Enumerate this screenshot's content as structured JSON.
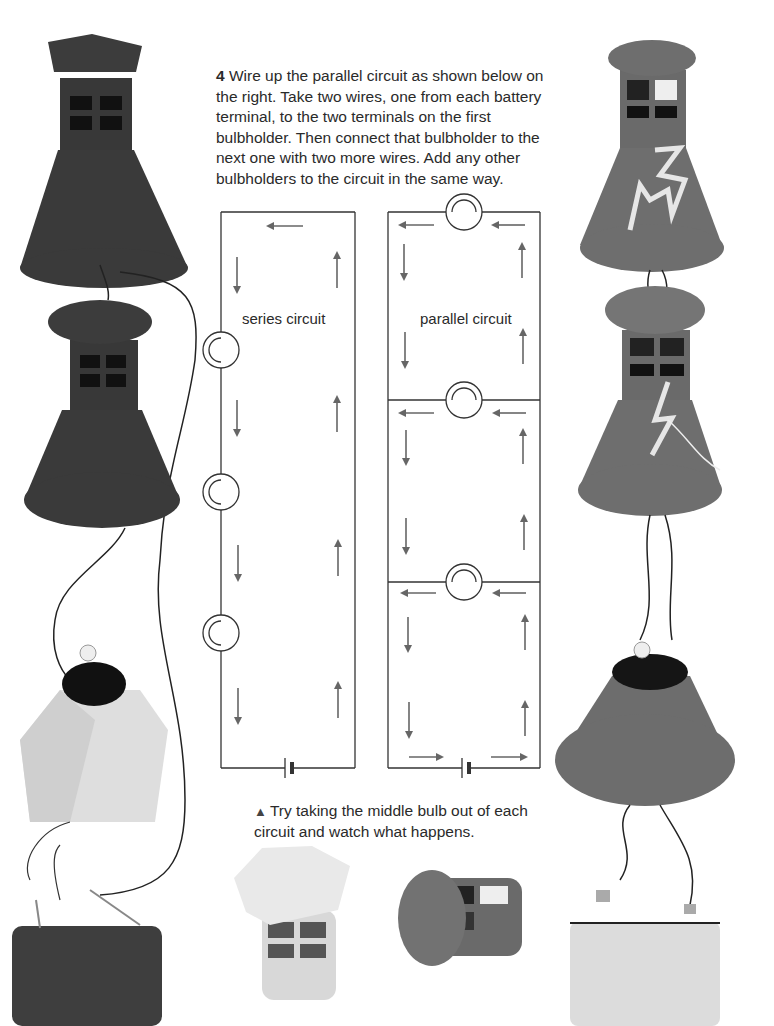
{
  "instruction": {
    "step_number": "4",
    "text": "Wire up the parallel circuit as shown below on the right. Take two wires, one from each battery terminal, to the two terminals on the first bulbholder. Then connect that bulbholder to the next one with two more wires. Add any other bulbholders to the circuit in the same way."
  },
  "diagrams": {
    "series": {
      "label": "series circuit",
      "bulb_count": 3
    },
    "parallel": {
      "label": "parallel circuit",
      "bulb_count": 3
    }
  },
  "caption": {
    "marker_icon": "up-triangle",
    "text": "Try taking the middle bulb out of each circuit and watch what happens."
  },
  "photos": {
    "left_column": [
      "dark-gray lamp with chimney cap",
      "dark-gray lamp with round cap",
      "pale hexagonal shade with bulb",
      "dark battery with clips"
    ],
    "right_column": [
      "gray lamp with cut-out pattern",
      "gray lamp with zigzag",
      "gray cone shade with bulbholder",
      "light battery with clips"
    ],
    "bottom_center": [
      "pale hexagon-cap tower",
      "gray round-cap tower lying on side"
    ]
  },
  "colors": {
    "dark_lamp": "#3a3a3a",
    "mid_lamp": "#6e6e6e",
    "pale_shade": "#dcdcdc",
    "arrow": "#666666",
    "line": "#333333"
  }
}
